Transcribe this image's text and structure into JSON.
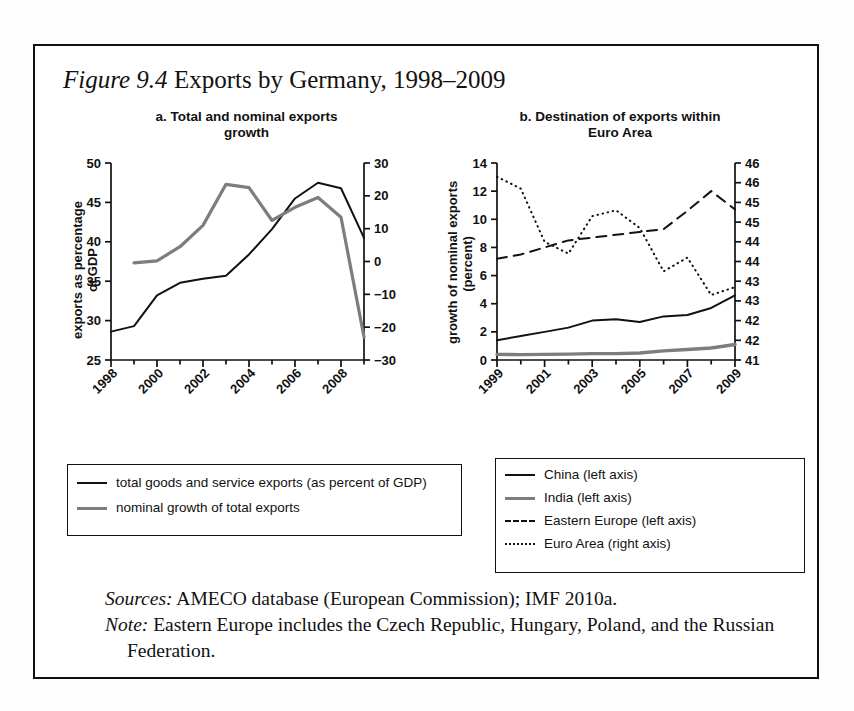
{
  "figure": {
    "number_label": "Figure 9.4",
    "caption": " Exports by Germany, 1998–2009"
  },
  "panel_a": {
    "title_line1": "a. Total and nominal exports",
    "title_line2": "growth",
    "left_axis_title_line1": "exports as percentage",
    "left_axis_title_line2": "of GDP"
  },
  "panel_b": {
    "title_line1": "b. Destination of exports within",
    "title_line2": "Euro Area",
    "left_axis_title_line1": "growth of nominal exports",
    "left_axis_title_line2": "(percent)"
  },
  "legend_a": {
    "items": [
      {
        "label": "total goods and service exports (as percent of GDP)",
        "style": "solid-black",
        "color": "#111111"
      },
      {
        "label": "nominal growth of total exports",
        "style": "solid-gray",
        "color": "#7d7d7d"
      }
    ]
  },
  "legend_b": {
    "items": [
      {
        "label": "China (left axis)",
        "style": "solid-black",
        "color": "#111111"
      },
      {
        "label": "India (left axis)",
        "style": "solid-gray",
        "color": "#7d7d7d"
      },
      {
        "label": "Eastern Europe (left axis)",
        "style": "dashed",
        "color": "#111111"
      },
      {
        "label": "Euro Area (right axis)",
        "style": "dotted",
        "color": "#111111"
      }
    ]
  },
  "notes": {
    "sources_lead": "Sources:",
    "sources_text": " AMECO database (European Commission); IMF 2010a.",
    "note_lead": "Note:",
    "note_text": " Eastern Europe includes the Czech Republic, Hungary, Poland, and the Russian Federation."
  },
  "chart_data": [
    {
      "id": "panel-a",
      "type": "line",
      "title": "a. Total and nominal exports growth",
      "xlabel": "",
      "ylabel": "exports as percentage of GDP",
      "y2label": "",
      "x": [
        1998,
        1999,
        2000,
        2001,
        2002,
        2003,
        2004,
        2005,
        2006,
        2007,
        2008,
        2009
      ],
      "xlim": [
        1998,
        2009
      ],
      "xticks_major": [
        "1998",
        "2000",
        "2002",
        "2004",
        "2006",
        "2008"
      ],
      "xticks_major_values": [
        1998,
        2000,
        2002,
        2004,
        2006,
        2008
      ],
      "xticks_minor_values": [
        1999,
        2001,
        2003,
        2005,
        2007,
        2009
      ],
      "ylim": [
        25,
        50
      ],
      "yticks": [
        "25",
        "30",
        "35",
        "40",
        "45",
        "50"
      ],
      "ytick_values": [
        25,
        30,
        35,
        40,
        45,
        50
      ],
      "y2lim": [
        -30,
        30
      ],
      "y2ticks": [
        "−30",
        "−20",
        "−10",
        "0",
        "10",
        "20",
        "30"
      ],
      "y2tick_values": [
        -30,
        -20,
        -10,
        0,
        10,
        20,
        30
      ],
      "grid": false,
      "legend_position": "below",
      "series": [
        {
          "name": "total goods and service exports (as percent of GDP)",
          "axis": "left",
          "style": "solid",
          "color": "#111111",
          "x": [
            1998,
            1999,
            2000,
            2001,
            2002,
            2003,
            2004,
            2005,
            2006,
            2007,
            2008,
            2009
          ],
          "values": [
            28.6,
            29.3,
            33.2,
            34.8,
            35.3,
            35.7,
            38.4,
            41.6,
            45.5,
            47.5,
            46.8,
            40.5
          ]
        },
        {
          "name": "nominal growth of total exports",
          "axis": "right",
          "style": "solid",
          "color": "#7d7d7d",
          "x": [
            1999,
            2000,
            2001,
            2002,
            2003,
            2004,
            2005,
            2006,
            2007,
            2008,
            2009
          ],
          "values": [
            -0.4,
            0.2,
            4.5,
            11.0,
            23.5,
            22.5,
            12.5,
            16.5,
            19.5,
            13.5,
            -23.0
          ]
        }
      ]
    },
    {
      "id": "panel-b",
      "type": "line",
      "title": "b. Destination of exports within Euro Area",
      "xlabel": "",
      "ylabel": "growth of nominal exports (percent)",
      "y2label": "",
      "x": [
        1999,
        2000,
        2001,
        2002,
        2003,
        2004,
        2005,
        2006,
        2007,
        2008,
        2009
      ],
      "xlim": [
        1999,
        2009
      ],
      "xticks_major": [
        "1999",
        "2001",
        "2003",
        "2005",
        "2007",
        "2009"
      ],
      "xticks_major_values": [
        1999,
        2001,
        2003,
        2005,
        2007,
        2009
      ],
      "xticks_minor_values": [
        2000,
        2002,
        2004,
        2006,
        2008
      ],
      "ylim": [
        0,
        14
      ],
      "yticks": [
        "0",
        "2",
        "4",
        "6",
        "8",
        "10",
        "12",
        "14"
      ],
      "ytick_values": [
        0,
        2,
        4,
        6,
        8,
        10,
        12,
        14
      ],
      "y2lim": [
        41,
        46
      ],
      "y2ticks": [
        "41",
        "42",
        "42",
        "43",
        "43",
        "44",
        "44",
        "45",
        "45",
        "46",
        "46"
      ],
      "y2tick_values": [
        41,
        41.5,
        42,
        42.5,
        43,
        43.5,
        44,
        44.5,
        45,
        45.5,
        46
      ],
      "grid": false,
      "legend_position": "below",
      "series": [
        {
          "name": "China (left axis)",
          "axis": "left",
          "style": "solid",
          "color": "#111111",
          "x": [
            1999,
            2000,
            2001,
            2002,
            2003,
            2004,
            2005,
            2006,
            2007,
            2008,
            2009
          ],
          "values": [
            1.4,
            1.7,
            2.0,
            2.3,
            2.8,
            2.9,
            2.7,
            3.1,
            3.2,
            3.7,
            4.6
          ]
        },
        {
          "name": "India (left axis)",
          "axis": "left",
          "style": "solid",
          "color": "#7d7d7d",
          "x": [
            1999,
            2000,
            2001,
            2002,
            2003,
            2004,
            2005,
            2006,
            2007,
            2008,
            2009
          ],
          "values": [
            0.4,
            0.38,
            0.4,
            0.42,
            0.45,
            0.45,
            0.5,
            0.65,
            0.75,
            0.85,
            1.1
          ]
        },
        {
          "name": "Eastern Europe (left axis)",
          "axis": "left",
          "style": "dashed",
          "color": "#111111",
          "x": [
            1999,
            2000,
            2001,
            2002,
            2003,
            2004,
            2005,
            2006,
            2007,
            2008,
            2009
          ],
          "values": [
            7.2,
            7.5,
            8.0,
            8.5,
            8.7,
            8.9,
            9.1,
            9.3,
            10.6,
            12.0,
            10.7
          ]
        },
        {
          "name": "Euro Area (right axis)",
          "axis": "right",
          "style": "dotted",
          "color": "#111111",
          "x": [
            1999,
            2000,
            2001,
            2002,
            2003,
            2004,
            2005,
            2006,
            2007,
            2008,
            2009
          ],
          "values": [
            45.65,
            45.35,
            44.0,
            43.7,
            44.65,
            44.8,
            44.35,
            43.25,
            43.6,
            42.65,
            42.85
          ]
        }
      ]
    }
  ]
}
